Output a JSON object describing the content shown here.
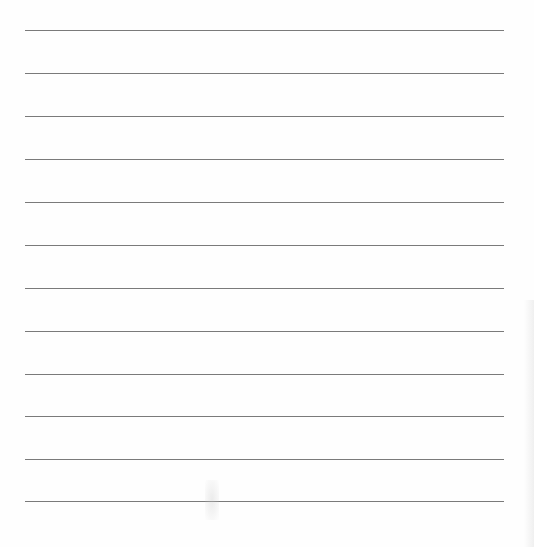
{
  "document": {
    "type": "lined-paper",
    "line_count": 12,
    "line_color": "#7a7a7a",
    "background_color": "#fefefe",
    "lines": [
      {
        "y": 30
      },
      {
        "y": 73
      },
      {
        "y": 116
      },
      {
        "y": 159
      },
      {
        "y": 202
      },
      {
        "y": 245
      },
      {
        "y": 288
      },
      {
        "y": 331
      },
      {
        "y": 374
      },
      {
        "y": 416
      },
      {
        "y": 459
      },
      {
        "y": 501
      }
    ]
  }
}
